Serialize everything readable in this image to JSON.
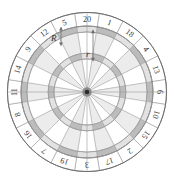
{
  "figure": {
    "type": "dartboard-diagram",
    "title": "",
    "shape": "circle"
  },
  "board": {
    "sector_count": 20,
    "sector_numbers": [
      20,
      1,
      18,
      4,
      13,
      6,
      10,
      15,
      2,
      17,
      3,
      19,
      7,
      16,
      8,
      11,
      14,
      9,
      12,
      5
    ],
    "number_ring_labels": {
      "top": [
        "20",
        "1"
      ],
      "upper_right": [
        "18",
        "4",
        "13"
      ],
      "right": [
        "6",
        "10"
      ],
      "lower_right": [
        "15",
        "2",
        "17"
      ],
      "bottom": [
        "3",
        "19"
      ],
      "lower_left": [
        "7",
        "16",
        "8"
      ],
      "left": [
        "11",
        "14"
      ],
      "upper_left": [
        "9",
        "12",
        "5"
      ]
    },
    "rings": [
      {
        "name": "outer-number-ring",
        "outer_radius": 82,
        "inner_radius": 68
      },
      {
        "name": "double-ring",
        "outer_radius": 68,
        "inner_radius": 62
      },
      {
        "name": "outer-single",
        "outer_radius": 62,
        "inner_radius": 40
      },
      {
        "name": "treble-ring",
        "outer_radius": 40,
        "inner_radius": 34
      },
      {
        "name": "inner-single",
        "outer_radius": 34,
        "inner_radius": 3
      },
      {
        "name": "bullseye",
        "outer_radius": 3,
        "inner_radius": 0
      }
    ]
  },
  "annotations": {
    "outer_radius_label": "R",
    "inner_radius_label": "r",
    "arrow_style": "double-headed"
  },
  "colors": {
    "sector_light": "#ffffff",
    "sector_shaded": "#ececec",
    "ring_dark": "#bcbcbc",
    "ring_light": "#e2e2e2",
    "stroke": "#9a9a9a",
    "stroke_strong": "#6e6e6e",
    "text": "#3a3a3a",
    "center": "#2b2b2b",
    "background": "#ffffff"
  }
}
